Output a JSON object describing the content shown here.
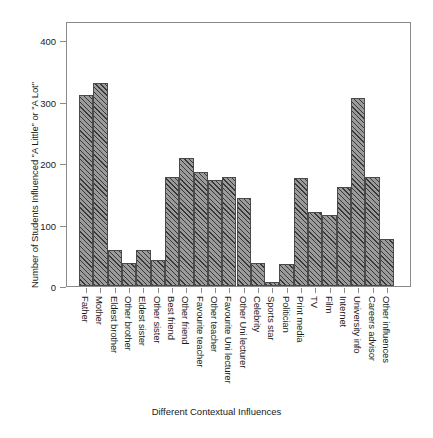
{
  "chart_data": {
    "type": "bar",
    "title": "",
    "xlabel": "Different Contextual Influences",
    "ylabel": "Number of Students Influenced \"A Little\" or \"A Lot\"",
    "ylim": [
      0,
      430
    ],
    "yticks": [
      0,
      100,
      200,
      300,
      400
    ],
    "ytick_labels": [
      "0",
      "100",
      "200",
      "300",
      "400"
    ],
    "grid": false,
    "legend": null,
    "categories": [
      "Father",
      "Mother",
      "Eldest brother",
      "Other brother",
      "Eldest sister",
      "Other sister",
      "Best friend",
      "Other friend",
      "Favourite teacher",
      "Other teacher",
      "Favourite Uni lecturer",
      "Other Uni lecturer",
      "Celebrity",
      "Sports star",
      "Politician",
      "Print media",
      "TV",
      "Film",
      "Internet",
      "University info",
      "Careers advisor",
      "Other influences"
    ],
    "values": [
      311,
      330,
      58,
      38,
      58,
      42,
      178,
      208,
      185,
      172,
      177,
      143,
      37,
      6,
      35,
      176,
      121,
      115,
      161,
      306,
      178,
      76
    ]
  }
}
